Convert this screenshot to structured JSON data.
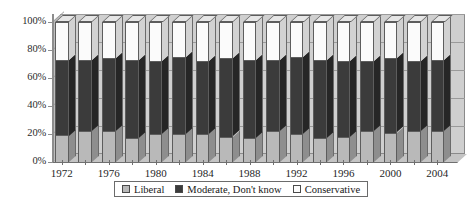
{
  "chart_data": {
    "type": "bar",
    "subtype": "stacked-percentage-3d",
    "title": "",
    "xlabel": "",
    "ylabel": "",
    "ylim": [
      0,
      100
    ],
    "y_ticks": [
      "0%",
      "20%",
      "40%",
      "60%",
      "80%",
      "100%"
    ],
    "y_tick_values": [
      0,
      20,
      40,
      60,
      80,
      100
    ],
    "grid": true,
    "legend_position": "bottom",
    "x_tick_labels": [
      "1972",
      "1976",
      "1980",
      "1984",
      "1988",
      "1992",
      "1996",
      "2000",
      "2004"
    ],
    "categories": [
      "1972",
      "1974",
      "1976",
      "1978",
      "1980",
      "1982",
      "1984",
      "1986",
      "1988",
      "1990",
      "1992",
      "1994",
      "1996",
      "1998",
      "2000",
      "2002",
      "2004"
    ],
    "series": [
      {
        "name": "Liberal",
        "color": "#b9b9b9",
        "values": [
          19,
          22,
          22,
          17,
          20,
          20,
          20,
          18,
          17,
          22,
          20,
          17,
          18,
          22,
          21,
          22,
          22
        ]
      },
      {
        "name": "Moderate, Don't know",
        "color": "#3b3b3b",
        "values": [
          54,
          51,
          52,
          56,
          52,
          55,
          52,
          56,
          56,
          51,
          55,
          56,
          54,
          50,
          53,
          50,
          51
        ]
      },
      {
        "name": "Conservative",
        "color": "#fbfbfb",
        "values": [
          27,
          27,
          26,
          27,
          28,
          25,
          28,
          26,
          27,
          27,
          25,
          27,
          28,
          28,
          26,
          28,
          27
        ]
      }
    ]
  },
  "legend": {
    "items": [
      {
        "label": "Liberal",
        "swatch_color": "#b9b9b9"
      },
      {
        "label": "Moderate, Don't know",
        "swatch_color": "#3b3b3b"
      },
      {
        "label": "Conservative",
        "swatch_color": "#fbfbfb"
      }
    ]
  },
  "colors": {
    "liberal": "#b9b9b9",
    "moderate": "#3b3b3b",
    "conservative": "#fbfbfb",
    "wall": "#cfcfcf",
    "gridline": "#9a9a9a",
    "outline": "#5d5d5d"
  }
}
